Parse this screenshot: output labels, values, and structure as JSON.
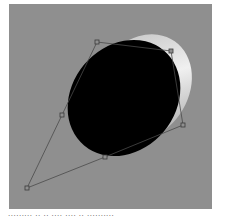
{
  "figure": {
    "background_color": "#8f8f8f",
    "shape": {
      "type": "ellipse-with-crescent-highlight",
      "fill_color": "#000000",
      "highlight_color": "#dcdcdc"
    },
    "control_path": {
      "stroke_color": "#4a4a4a",
      "points": [
        {
          "x": 97,
          "y": 42
        },
        {
          "x": 171,
          "y": 51
        },
        {
          "x": 183,
          "y": 125
        },
        {
          "x": 105,
          "y": 157
        },
        {
          "x": 27,
          "y": 188
        },
        {
          "x": 62,
          "y": 115
        }
      ]
    }
  },
  "caption": {
    "text": "·········  ··  ··  ····  ····  ··  ··········"
  }
}
